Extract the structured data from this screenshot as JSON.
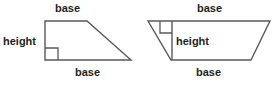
{
  "figure": {
    "stroke_color": "#58595b",
    "text_color": "#231f20",
    "background_color": "#ffffff",
    "shapes": [
      {
        "name": "right-trapezoid-left",
        "description": "Right trapezoid with vertical left side, shorter top base and longer bottom base",
        "labels": {
          "top": "base",
          "height": "height",
          "bottom": "base"
        },
        "right_angle_marker": "bottom-left-interior"
      },
      {
        "name": "inverted-trapezoid-right",
        "description": "Inverted isosceles trapezoid, wider top base and shorter bottom base, with interior vertical height segment",
        "labels": {
          "top": "base",
          "height": "height",
          "bottom": "base"
        },
        "right_angle_marker": "top-interior-left-of-height-segment"
      }
    ]
  },
  "labels": {
    "left_top_base": "base",
    "left_height": "height",
    "left_bottom_base": "base",
    "right_top_base": "base",
    "right_height": "height",
    "right_bottom_base": "base"
  }
}
